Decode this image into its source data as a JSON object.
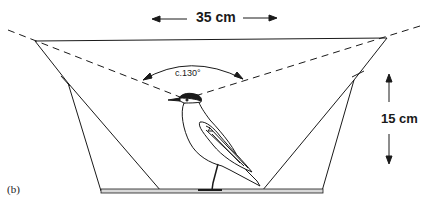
{
  "figure": {
    "panel_label": "(b)",
    "width_label": "35 cm",
    "height_label": "15 cm",
    "angle_label": "c.130°",
    "colors": {
      "line": "#1a1a1a",
      "background": "#ffffff",
      "base_fill": "#d8d8d8"
    }
  }
}
